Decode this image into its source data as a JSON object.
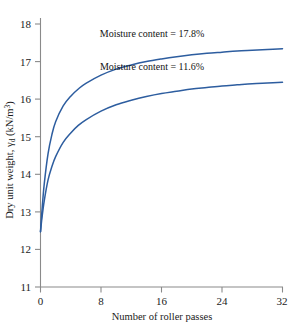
{
  "chart_data": {
    "type": "line",
    "title": "",
    "xlabel": "Number of roller passes",
    "ylabel": "Dry unit weight, γd (kN/m3)",
    "ylabel_main": "Dry unit weight, ",
    "ylabel_symbol": "γ",
    "ylabel_subscript": "d",
    "ylabel_units": " (kN/m",
    "ylabel_units_sup": "3",
    "ylabel_units_end": ")",
    "xlim": [
      0,
      32
    ],
    "ylim": [
      11,
      18
    ],
    "xticks": [
      0,
      8,
      16,
      24,
      32
    ],
    "yticks": [
      11,
      12,
      13,
      14,
      15,
      16,
      17,
      18
    ],
    "xtick_labels": [
      "0",
      "8",
      "16",
      "24",
      "32"
    ],
    "ytick_labels": [
      "11",
      "12",
      "13",
      "14",
      "15",
      "16",
      "17",
      "18"
    ],
    "grid": false,
    "legend_position": "inline-annotations",
    "curve_color": "#2d5d9f",
    "series": [
      {
        "name": "Moisture content = 17.8%",
        "annotation": "Moisture content = 17.8%",
        "x": [
          0,
          0.2,
          0.5,
          1,
          1.5,
          2,
          3,
          4,
          5,
          6,
          8,
          10,
          12,
          14,
          16,
          18,
          20,
          22,
          24,
          26,
          28,
          30,
          32
        ],
        "y": [
          12.47,
          13.05,
          13.75,
          14.55,
          15.05,
          15.4,
          15.82,
          16.08,
          16.27,
          16.42,
          16.64,
          16.8,
          16.91,
          17.0,
          17.07,
          17.13,
          17.18,
          17.22,
          17.25,
          17.28,
          17.3,
          17.32,
          17.34
        ]
      },
      {
        "name": "Moisture content = 11.6%",
        "annotation": "Moisture content = 11.6%",
        "x": [
          0,
          0.2,
          0.5,
          1,
          1.5,
          2,
          3,
          4,
          5,
          6,
          8,
          10,
          12,
          14,
          16,
          18,
          20,
          22,
          24,
          26,
          28,
          30,
          32
        ],
        "y": [
          12.47,
          12.85,
          13.3,
          13.85,
          14.2,
          14.47,
          14.85,
          15.1,
          15.3,
          15.45,
          15.68,
          15.85,
          15.97,
          16.07,
          16.15,
          16.21,
          16.27,
          16.31,
          16.35,
          16.38,
          16.41,
          16.43,
          16.45
        ]
      }
    ],
    "annotations": [
      {
        "text": "Moisture content = 17.8%",
        "x_px": 152,
        "y_px": 37
      },
      {
        "text": "Moisture content = 11.6%",
        "x_px": 152,
        "y_px": 70
      }
    ],
    "caption": ""
  }
}
